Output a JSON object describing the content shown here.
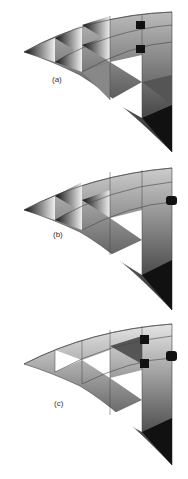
{
  "figure": {
    "panels": [
      {
        "id": "a",
        "label": "(a)",
        "lights": 2,
        "shading": "dark-gradient"
      },
      {
        "id": "b",
        "label": "(b)",
        "lights": 1,
        "shading": "dark-gradient"
      },
      {
        "id": "c",
        "label": "(c)",
        "lights": 3,
        "shading": "light-gradient"
      }
    ],
    "colors": {
      "background": "#ffffff",
      "mesh_line": "#444444",
      "light_body": "#111111"
    }
  }
}
